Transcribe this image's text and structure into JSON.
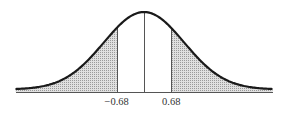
{
  "chart_data": {
    "type": "area",
    "title": "",
    "subtitle": "",
    "xlabel": "",
    "ylabel": "",
    "distribution": "normal",
    "mean": 0,
    "sd": 1,
    "xlim": [
      -3.2,
      3.2
    ],
    "grid": false,
    "legend": null,
    "shaded_regions": [
      {
        "name": "left-tail",
        "from": -3.2,
        "to": -0.68
      },
      {
        "name": "right-tail",
        "from": 0.68,
        "to": 3.2
      }
    ],
    "vertical_lines": [
      -0.68,
      0,
      0.68
    ],
    "tick_labels": [
      {
        "x": -0.68,
        "label": "−0.68"
      },
      {
        "x": 0.68,
        "label": "0.68"
      }
    ]
  },
  "colors": {
    "curve": "#1a1a1a",
    "shade": "#d9d9d9",
    "hatch": "#9a9a9a",
    "lines": "#555555",
    "baseline": "#555555"
  },
  "labels": {
    "left_tick": "−0.68",
    "right_tick": "0.68"
  }
}
